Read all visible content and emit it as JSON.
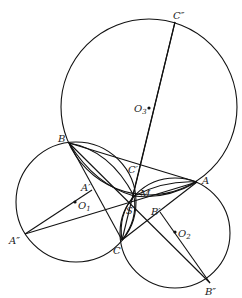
{
  "diagram": {
    "type": "geometry",
    "circles": [
      {
        "name": "O3",
        "cx": 149,
        "cy": 107,
        "r": 88
      },
      {
        "name": "O1",
        "cx": 76,
        "cy": 202,
        "r": 60
      },
      {
        "name": "O2",
        "cx": 175,
        "cy": 233,
        "r": 55
      }
    ],
    "points": {
      "C2": {
        "label": "C″",
        "x": 175,
        "y": 22
      },
      "O3": {
        "label": "O",
        "sub": "3",
        "x": 149,
        "y": 108
      },
      "B": {
        "label": "B",
        "x": 69,
        "y": 143
      },
      "Cp": {
        "label": "C′",
        "x": 135,
        "y": 172
      },
      "A": {
        "label": "A",
        "x": 197,
        "y": 182
      },
      "Ap": {
        "label": "A′",
        "x": 92,
        "y": 190
      },
      "M": {
        "label": "M",
        "x": 134,
        "y": 196
      },
      "O1": {
        "label": "O",
        "sub": "1",
        "x": 75,
        "y": 202
      },
      "S": {
        "label": "S",
        "x": 130,
        "y": 203
      },
      "Bp": {
        "label": "B′",
        "x": 160,
        "y": 212
      },
      "O2": {
        "label": "O",
        "sub": "2",
        "x": 175,
        "y": 232
      },
      "A2": {
        "label": "A″",
        "x": 25,
        "y": 234
      },
      "C": {
        "label": "C",
        "x": 122,
        "y": 240
      },
      "B2": {
        "label": "B″",
        "x": 210,
        "y": 283
      }
    }
  }
}
